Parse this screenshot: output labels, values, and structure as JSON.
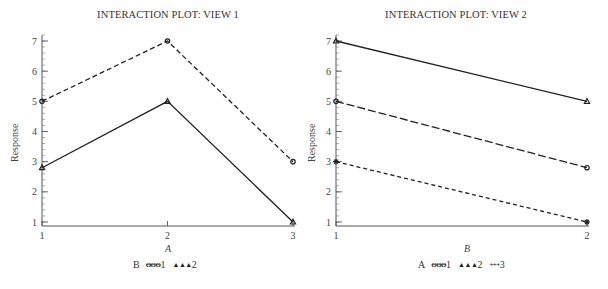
{
  "chart_data": [
    {
      "type": "line",
      "title": "INTERACTION PLOT: VIEW 1",
      "xlabel": "A",
      "ylabel": "Response",
      "x": [
        1,
        2,
        3
      ],
      "xticks": [
        "1",
        "2",
        "3"
      ],
      "yticks": [
        "1",
        "2",
        "3",
        "4",
        "5",
        "6",
        "7"
      ],
      "ylim": [
        1,
        7
      ],
      "legend_title": "B",
      "legend_position": "bottom",
      "series": [
        {
          "name": "1",
          "marker": "circle",
          "line": "dashed",
          "values": [
            5,
            7,
            3
          ]
        },
        {
          "name": "2",
          "marker": "triangle",
          "line": "solid",
          "values": [
            2.8,
            5,
            1
          ]
        }
      ]
    },
    {
      "type": "line",
      "title": "INTERACTION PLOT: VIEW 2",
      "xlabel": "B",
      "ylabel": "Response",
      "x": [
        1,
        2
      ],
      "xticks": [
        "1",
        "2"
      ],
      "yticks": [
        "1",
        "2",
        "3",
        "4",
        "5",
        "6",
        "7"
      ],
      "ylim": [
        1,
        7
      ],
      "legend_title": "A",
      "legend_position": "bottom",
      "series": [
        {
          "name": "1",
          "marker": "circle",
          "line": "long-dashed",
          "values": [
            5,
            2.8
          ]
        },
        {
          "name": "2",
          "marker": "triangle",
          "line": "solid",
          "values": [
            7,
            5
          ]
        },
        {
          "name": "3",
          "marker": "plus",
          "line": "short-dashed",
          "values": [
            3,
            1
          ]
        }
      ]
    }
  ],
  "left": {
    "title": "INTERACTION PLOT: VIEW 1",
    "xlabel": "A",
    "ylabel": "Response",
    "legend": {
      "title": "B",
      "items": [
        {
          "symbol": "ΘΘΘ",
          "label": "1"
        },
        {
          "symbol": "▲▲▲",
          "label": "2"
        }
      ]
    }
  },
  "right": {
    "title": "INTERACTION PLOT: VIEW 2",
    "xlabel": "B",
    "ylabel": "Response",
    "legend": {
      "title": "A",
      "items": [
        {
          "symbol": "ΘΘΘ",
          "label": "1"
        },
        {
          "symbol": "▲▲▲",
          "label": "2"
        },
        {
          "symbol": "+++",
          "label": "3"
        }
      ]
    }
  }
}
